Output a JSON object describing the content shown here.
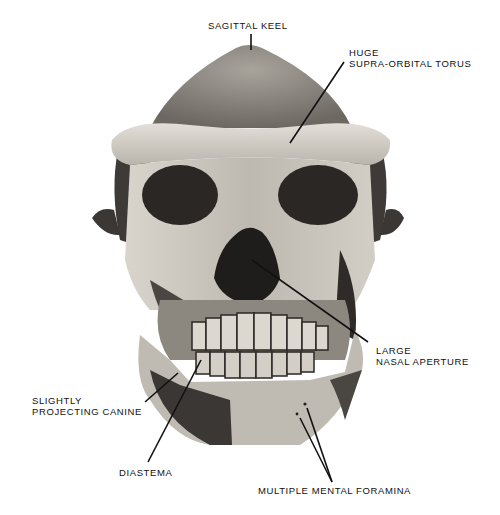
{
  "figure": {
    "labels": {
      "sagittal_keel": [
        "SAGITTAL KEEL"
      ],
      "supra_orbital": [
        "HUGE",
        "SUPRA-ORBITAL TORUS"
      ],
      "nasal_aperture": [
        "LARGE",
        "NASAL APERTURE"
      ],
      "canine": [
        "SLIGHTLY",
        "PROJECTING CANINE"
      ],
      "diastema": [
        "DIASTEMA"
      ],
      "foramina": [
        "MULTIPLE MENTAL FORAMINA"
      ]
    },
    "colors": {
      "background": "#ffffff",
      "bone_light": "#cfcac2",
      "bone_mid": "#9a958d",
      "bone_dark": "#4a4642",
      "cavity": "#1c1a19",
      "line": "#111111"
    }
  }
}
